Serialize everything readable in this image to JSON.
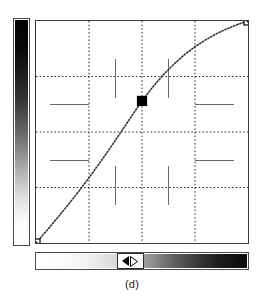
{
  "figure": {
    "caption": "(d)",
    "widget_name": "tone-transfer-curve-editor"
  },
  "vertical_ramp": {
    "name": "output-intensity-ramp",
    "orientation": "vertical",
    "top_color": "#000000",
    "bottom_color": "#ffffff"
  },
  "horizontal_ramp": {
    "name": "input-intensity-slider",
    "orientation": "horizontal",
    "left_color": "#ffffff",
    "right_color": "#000000",
    "thumb_position_percent": 44,
    "thumb_left_arrow": "◀",
    "thumb_right_arrow": "▷"
  },
  "plot": {
    "name": "transfer-function-plot",
    "border_color": "#3c3c3c",
    "background_color": "#ffffff",
    "grid": {
      "visible": true,
      "style": "dotted",
      "color": "#222222",
      "vertical_fractions": [
        0.25,
        0.5,
        0.75
      ],
      "horizontal_fractions": [
        0.25,
        0.5,
        0.75
      ]
    },
    "ticks": {
      "visible": true,
      "style": "solid",
      "color": "#6a6a6a",
      "vertical_tick_fractions": [
        0.375,
        0.625
      ],
      "horizontal_tick_fractions": [
        0.375,
        0.625
      ]
    }
  },
  "chart_data": {
    "type": "line",
    "title": "",
    "xlabel": "",
    "ylabel": "",
    "xlim": [
      0,
      1
    ],
    "ylim": [
      0,
      1
    ],
    "grid": true,
    "legend": "none",
    "series": [
      {
        "name": "tone-curve",
        "style": "dotted",
        "color": "#333333",
        "x": [
          0.0,
          0.05,
          0.1,
          0.15,
          0.2,
          0.25,
          0.3,
          0.35,
          0.4,
          0.45,
          0.5,
          0.55,
          0.6,
          0.65,
          0.7,
          0.75,
          0.8,
          0.85,
          0.9,
          0.95,
          1.0
        ],
        "y": [
          0.0,
          0.055,
          0.112,
          0.17,
          0.231,
          0.294,
          0.36,
          0.428,
          0.499,
          0.57,
          0.64,
          0.702,
          0.757,
          0.805,
          0.848,
          0.884,
          0.915,
          0.942,
          0.965,
          0.984,
          1.0
        ]
      }
    ],
    "control_points": [
      {
        "name": "lower-left-handle",
        "x": 0.0,
        "y": 0.0,
        "filled": false
      },
      {
        "name": "mid-handle-selected",
        "x": 0.5,
        "y": 0.64,
        "filled": true
      },
      {
        "name": "upper-right-handle",
        "x": 1.0,
        "y": 1.0,
        "filled": false
      }
    ]
  }
}
